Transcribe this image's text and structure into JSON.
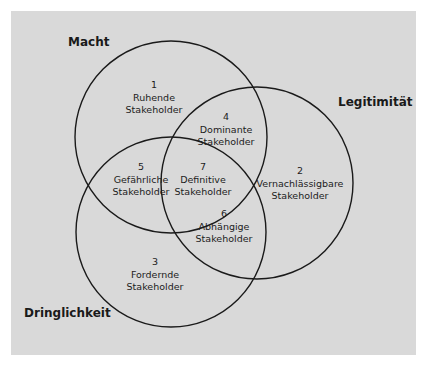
{
  "diagram": {
    "type": "venn",
    "background_color": "#d9d9d9",
    "stroke_color": "#1a1a1a",
    "sets": [
      {
        "id": "macht",
        "label": "Macht",
        "cx": 171,
        "cy": 137,
        "r": 96
      },
      {
        "id": "legitimitaet",
        "label": "Legitimität",
        "cx": 257,
        "cy": 183,
        "r": 96
      },
      {
        "id": "dringlichkeit",
        "label": "Dringlichkeit",
        "cx": 171,
        "cy": 232,
        "r": 95
      }
    ],
    "regions": [
      {
        "number": "1",
        "name": "Ruhende",
        "suffix": "Stakeholder",
        "sets": [
          "Macht"
        ]
      },
      {
        "number": "2",
        "name": "Vernachlässigbare",
        "suffix": "Stakeholder",
        "sets": [
          "Legitimität"
        ]
      },
      {
        "number": "3",
        "name": "Fordernde",
        "suffix": "Stakeholder",
        "sets": [
          "Dringlichkeit"
        ]
      },
      {
        "number": "4",
        "name": "Dominante",
        "suffix": "Stakeholder",
        "sets": [
          "Macht",
          "Legitimität"
        ]
      },
      {
        "number": "5",
        "name": "Gefährliche",
        "suffix": "Stakeholder",
        "sets": [
          "Macht",
          "Dringlichkeit"
        ]
      },
      {
        "number": "6",
        "name": "Abhängige",
        "suffix": "Stakeholder",
        "sets": [
          "Legitimität",
          "Dringlichkeit"
        ]
      },
      {
        "number": "7",
        "name": "Definitive",
        "suffix": "Stakeholder",
        "sets": [
          "Macht",
          "Legitimität",
          "Dringlichkeit"
        ]
      }
    ]
  }
}
